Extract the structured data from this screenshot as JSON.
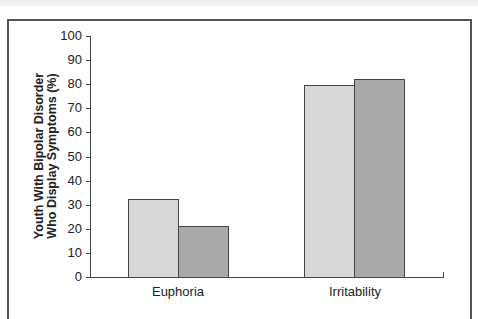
{
  "chart_data": {
    "type": "bar",
    "title": "",
    "xlabel": "",
    "ylabel": "Youth With Bipolar Disorder Who Display Symptoms (%)",
    "ylabel_lines": [
      "Youth With Bipolar Disorder",
      "Who Display Symptoms (%)"
    ],
    "categories": [
      "Euphoria",
      "Irritability"
    ],
    "series": [
      {
        "name": "Series 1",
        "color": "#d8d8d8",
        "values": [
          32.5,
          79.5
        ]
      },
      {
        "name": "Series 2",
        "color": "#a9a9a9",
        "values": [
          21,
          82
        ]
      }
    ],
    "ylim": [
      0,
      100
    ],
    "yticks": [
      0,
      10,
      20,
      30,
      40,
      50,
      60,
      70,
      80,
      90,
      100
    ],
    "grid": false,
    "legend": "none"
  }
}
